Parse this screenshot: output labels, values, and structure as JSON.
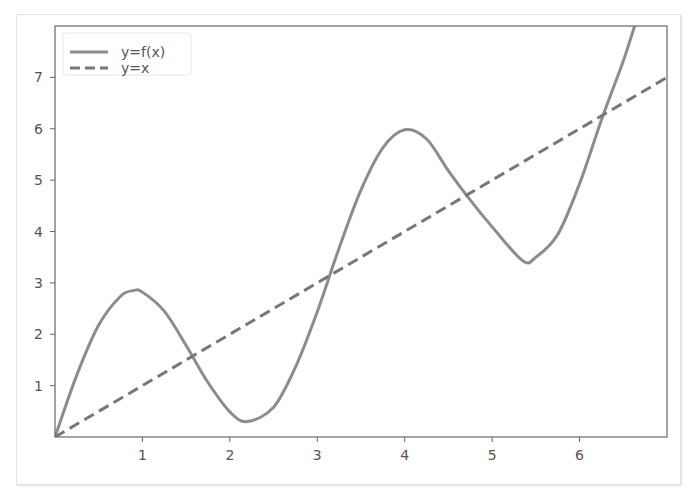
{
  "chart_data": {
    "type": "line",
    "title": "",
    "xlabel": "",
    "ylabel": "",
    "xlim": [
      0,
      7
    ],
    "ylim": [
      0,
      8
    ],
    "grid": false,
    "legend_placement": "top-left",
    "x_ticks": [
      1,
      2,
      3,
      4,
      5,
      6
    ],
    "x_tick_labels": [
      "1",
      "2",
      "3",
      "4",
      "5",
      "6"
    ],
    "y_ticks": [
      1,
      2,
      3,
      4,
      5,
      6,
      7
    ],
    "y_tick_labels": [
      "1",
      "2",
      "3",
      "4",
      "5",
      "6",
      "7"
    ],
    "series": [
      {
        "name": "y=f(x)",
        "style": "solid",
        "color": "#8c8c8c",
        "x": [
          0,
          0.25,
          0.5,
          0.75,
          0.9,
          1.0,
          1.25,
          1.5,
          1.75,
          2.0,
          2.2,
          2.5,
          2.75,
          3.0,
          3.25,
          3.5,
          3.75,
          4.0,
          4.25,
          4.5,
          4.75,
          5.0,
          5.35,
          5.5,
          5.75,
          6.0,
          6.25,
          6.5,
          6.63
        ],
        "y": [
          0,
          1.21,
          2.18,
          2.74,
          2.85,
          2.82,
          2.45,
          1.78,
          1.06,
          0.49,
          0.3,
          0.58,
          1.36,
          2.44,
          3.68,
          4.81,
          5.63,
          5.98,
          5.8,
          5.18,
          4.61,
          4.09,
          3.43,
          3.5,
          3.94,
          4.93,
          6.17,
          7.32,
          8.0
        ]
      },
      {
        "name": "y=x",
        "style": "dashed",
        "color": "#777777",
        "x": [
          0,
          7
        ],
        "y": [
          0,
          7
        ]
      }
    ],
    "function_model": "f(x) ≈ x + 2·sin(2x)"
  }
}
